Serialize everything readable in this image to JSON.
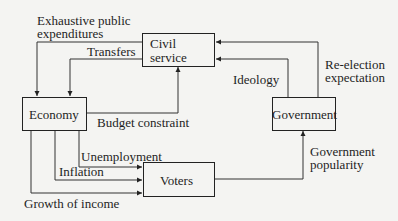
{
  "nodes": {
    "civil_service": {
      "line1": "Civil",
      "line2": "service"
    },
    "economy": {
      "label": "Economy"
    },
    "government": {
      "label": "Government"
    },
    "voters": {
      "label": "Voters"
    }
  },
  "edges": {
    "exhaustive_public_expenditures": {
      "line1": "Exhaustive public",
      "line2": "expenditures",
      "from": "civil_service",
      "to": "economy"
    },
    "transfers": {
      "label": "Transfers",
      "from": "civil_service",
      "to": "economy"
    },
    "budget_constraint": {
      "label": "Budget constraint",
      "from": "economy",
      "to": "civil_service"
    },
    "ideology": {
      "label": "Ideology",
      "from": "government",
      "to": "civil_service"
    },
    "re_election_expectation": {
      "line1": "Re-election",
      "line2": "expectation",
      "from": "government",
      "to": "civil_service"
    },
    "unemployment": {
      "label": "Unemployment",
      "from": "economy",
      "to": "voters"
    },
    "inflation": {
      "label": "Inflation",
      "from": "economy",
      "to": "voters"
    },
    "growth_of_income": {
      "label": "Growth of income",
      "from": "economy",
      "to": "voters"
    },
    "government_popularity": {
      "line1": "Government",
      "line2": "popularity",
      "from": "voters",
      "to": "government"
    }
  },
  "colors": {
    "line": "#333333",
    "text": "#1e1e1e",
    "background": "#f4f4f2"
  }
}
